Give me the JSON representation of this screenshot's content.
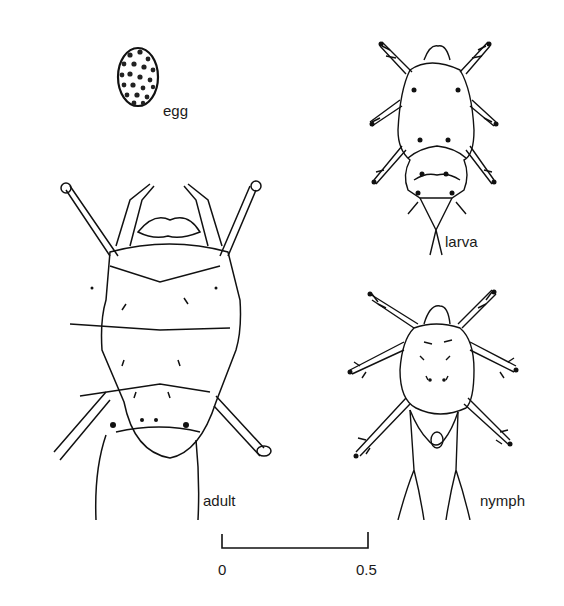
{
  "figure": {
    "stages": [
      {
        "id": "egg",
        "label": "egg"
      },
      {
        "id": "larva",
        "label": "larva"
      },
      {
        "id": "adult",
        "label": "adult"
      },
      {
        "id": "nymph",
        "label": "nymph"
      }
    ],
    "scale_bar": {
      "start_label": "0",
      "end_label": "0.5"
    }
  }
}
